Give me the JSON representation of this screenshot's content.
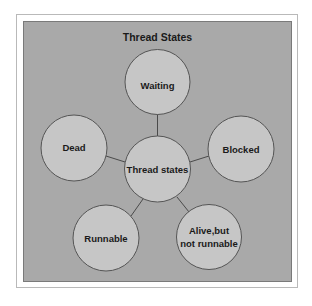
{
  "diagram": {
    "title": "Thread States",
    "colors": {
      "panel": "#a9a9a9",
      "node_fill": "#c6c6c6",
      "node_stroke": "#555555",
      "edge": "#4a4a4a",
      "text": "#1a1a1a"
    },
    "center_node": {
      "id": "thread-states",
      "label": "Thread states"
    },
    "nodes": [
      {
        "id": "waiting",
        "label_lines": [
          "Waiting"
        ]
      },
      {
        "id": "dead",
        "label_lines": [
          "Dead"
        ]
      },
      {
        "id": "blocked",
        "label_lines": [
          "Blocked"
        ]
      },
      {
        "id": "runnable",
        "label_lines": [
          "Runnable"
        ]
      },
      {
        "id": "alive-not-runnable",
        "label_lines": [
          "Alive,but",
          "not runnable"
        ]
      }
    ],
    "edges": [
      {
        "from": "thread-states",
        "to": "waiting"
      },
      {
        "from": "thread-states",
        "to": "dead"
      },
      {
        "from": "thread-states",
        "to": "blocked"
      },
      {
        "from": "thread-states",
        "to": "runnable"
      },
      {
        "from": "thread-states",
        "to": "alive-not-runnable"
      }
    ]
  }
}
